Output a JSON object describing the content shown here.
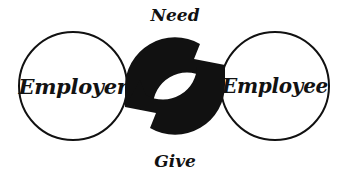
{
  "diagram": {
    "background_color": "#ffffff",
    "stroke_color": "#111111",
    "nodes": [
      {
        "id": "employer",
        "label": "Employer",
        "shape": "circle",
        "position": "left"
      },
      {
        "id": "employee",
        "label": "Employee",
        "shape": "circle",
        "position": "right"
      }
    ],
    "flows": [
      {
        "id": "need",
        "label": "Need",
        "position": "top",
        "direction": "employer-to-employee"
      },
      {
        "id": "give",
        "label": "Give",
        "position": "bottom",
        "direction": "employee-to-employer"
      }
    ],
    "center_graphic": {
      "name": "circular-arrows",
      "arrow_count": 2,
      "rotation": "clockwise",
      "fill_color": "#111111"
    }
  }
}
